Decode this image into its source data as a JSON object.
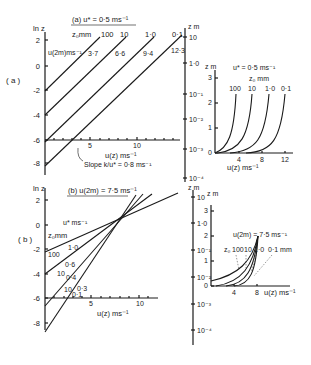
{
  "figure": {
    "panel_a": {
      "label": "( a )",
      "title": "(a)  u* = 0·5 ms⁻¹",
      "z0_header": "z₀mm",
      "u2_header": "u(2m)ms⁻¹",
      "left_axis_label": "ln z",
      "right_axis_label": "z m",
      "x_axis_label": "u(z) ms⁻¹",
      "slope_label": "Slope  k/u* = 0·8 ms⁻¹",
      "left_ticks": [
        "2",
        "0",
        "-2",
        "-4",
        "-6",
        "-8"
      ],
      "right_ticks": [
        "10",
        "1·0",
        "10⁻¹",
        "10⁻²",
        "10⁻³",
        "10⁻⁴"
      ],
      "x_ticks": [
        "5",
        "10"
      ],
      "lines": [
        {
          "z0": "100",
          "u2": "3·7"
        },
        {
          "z0": "10",
          "u2": "6·6"
        },
        {
          "z0": "1·0",
          "u2": "9·4"
        },
        {
          "z0": "0·1",
          "u2": "12·3"
        }
      ]
    },
    "inset_a": {
      "title": "u* = 0·5 ms⁻¹",
      "z0_header": "z₀ mm",
      "y_label": "z m",
      "x_label": "u(z) ms⁻¹",
      "y_ticks": [
        "0",
        "1",
        "2",
        "3"
      ],
      "x_ticks": [
        "4",
        "8",
        "12"
      ],
      "curve_labels": [
        "100",
        "10",
        "1·0",
        "0·1"
      ]
    },
    "panel_b": {
      "label": "( b )",
      "title": "(b)  u(2m) = 7·5 ms⁻¹",
      "ustar_header": "u* ms⁻¹",
      "z0_header": "z₀mm",
      "left_axis_label": "ln z",
      "right_axis_label": "z m",
      "x_axis_label": "u(z) ms⁻¹",
      "left_ticks": [
        "2",
        "0",
        "-2",
        "-4",
        "-6",
        "-8"
      ],
      "right_ticks": [
        "10",
        "1·0",
        "10⁻¹",
        "10⁻²",
        "10⁻³",
        "10⁻⁴"
      ],
      "x_ticks": [
        "5",
        "10"
      ],
      "lines": [
        {
          "z0": "100",
          "ustar": "1·0"
        },
        {
          "z0": "10",
          "ustar": "0·6"
        },
        {
          "z0": "1·0",
          "ustar": "0·4"
        },
        {
          "z0": "0·1",
          "ustar": "0·3"
        }
      ],
      "ustar_labels": [
        "1·0",
        "0·6",
        "0·4",
        "0·3",
        "0·1"
      ],
      "z0_labels": [
        "100",
        "10",
        "10"
      ]
    },
    "inset_b": {
      "title": "u(2m) = 7·5 ms⁻¹",
      "y_label": "z m",
      "x_label": "u(z) ms⁻¹",
      "y_ticks": [
        "0",
        "1",
        "2",
        "3"
      ],
      "x_ticks": [
        "4",
        "8"
      ],
      "z0_label": "z₀",
      "curve_labels": [
        "100",
        "10",
        "1·0",
        "0·1 mm"
      ]
    }
  }
}
